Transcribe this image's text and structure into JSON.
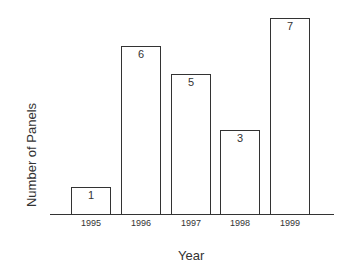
{
  "chart_data": {
    "type": "bar",
    "title": "",
    "xlabel": "Year",
    "ylabel": "Number of Panels",
    "categories": [
      "1995",
      "1996",
      "1997",
      "1998",
      "1999"
    ],
    "values": [
      1,
      6,
      5,
      3,
      7
    ],
    "data_labels": [
      "1",
      "6",
      "5",
      "3",
      "7"
    ],
    "ylim": [
      0,
      7.0
    ],
    "grid": false,
    "legend": null,
    "bar_fill": "#ffffff",
    "bar_stroke": "#333333"
  }
}
